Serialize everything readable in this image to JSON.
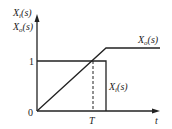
{
  "diagram": {
    "y_axis_label_top": "X",
    "y_axis_label_top_sub": "i",
    "y_axis_label_top_arg": "(s)",
    "y_axis_label_bottom": "X",
    "y_axis_label_bottom_sub": "o",
    "y_axis_label_bottom_arg": "(s)",
    "x_axis_label": "t",
    "origin_label": "0",
    "level_label": "1",
    "time_marker_label": "T",
    "curve_output_label": "X",
    "curve_output_sub": "o",
    "curve_output_arg": "(s)",
    "curve_input_label": "X",
    "curve_input_sub": "i",
    "curve_input_arg": "(s)",
    "line_color": "#222222"
  }
}
